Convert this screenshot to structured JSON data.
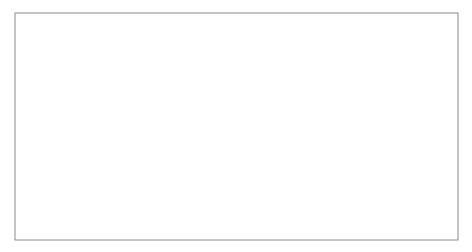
{
  "diagram": {
    "input_label_lines": [
      "Input data streams",
      "from sources like",
      "Kafka, Flume,",
      "Twitter or Amazon",
      "Kinesis"
    ],
    "output_label_lines": [
      "Transformed",
      "data streams"
    ],
    "threads": [
      {
        "label": "Thread1"
      },
      {
        "label": "Thread2"
      }
    ],
    "nodes": [
      {
        "id": "spout1",
        "label": "Spout1"
      },
      {
        "id": "bolt1",
        "label": "Bolt1"
      },
      {
        "id": "bolt2a",
        "label": "Bolt2"
      },
      {
        "id": "bolt3",
        "label": "Bolt3"
      },
      {
        "id": "bolt5",
        "label": "Bolt5"
      },
      {
        "id": "spout2",
        "label": "Spout2"
      },
      {
        "id": "bolt2b",
        "label": "Bolt2"
      },
      {
        "id": "bolt4",
        "label": "Bolt4"
      }
    ],
    "edges": [
      {
        "from": "Spout1",
        "to": "Bolt1",
        "thread": "Thread1"
      },
      {
        "from": "Spout1",
        "to": "Bolt2",
        "thread": "Thread1"
      },
      {
        "from": "Bolt1",
        "to": "Bolt3",
        "thread": "Thread1"
      },
      {
        "from": "Bolt2",
        "to": "Bolt3",
        "thread": "Thread1"
      },
      {
        "from": "Bolt3",
        "to": "Bolt5",
        "thread": "Thread1"
      },
      {
        "from": "Spout2",
        "to": "Bolt2",
        "thread": "Thread2"
      },
      {
        "from": "Bolt2",
        "to": "Bolt4",
        "thread": "Thread2"
      }
    ],
    "colors": {
      "arrow_fill": "#7a7a7a",
      "arrow_stroke": "#555555",
      "frame": "#8a8a8a",
      "dash": "#333333"
    }
  }
}
